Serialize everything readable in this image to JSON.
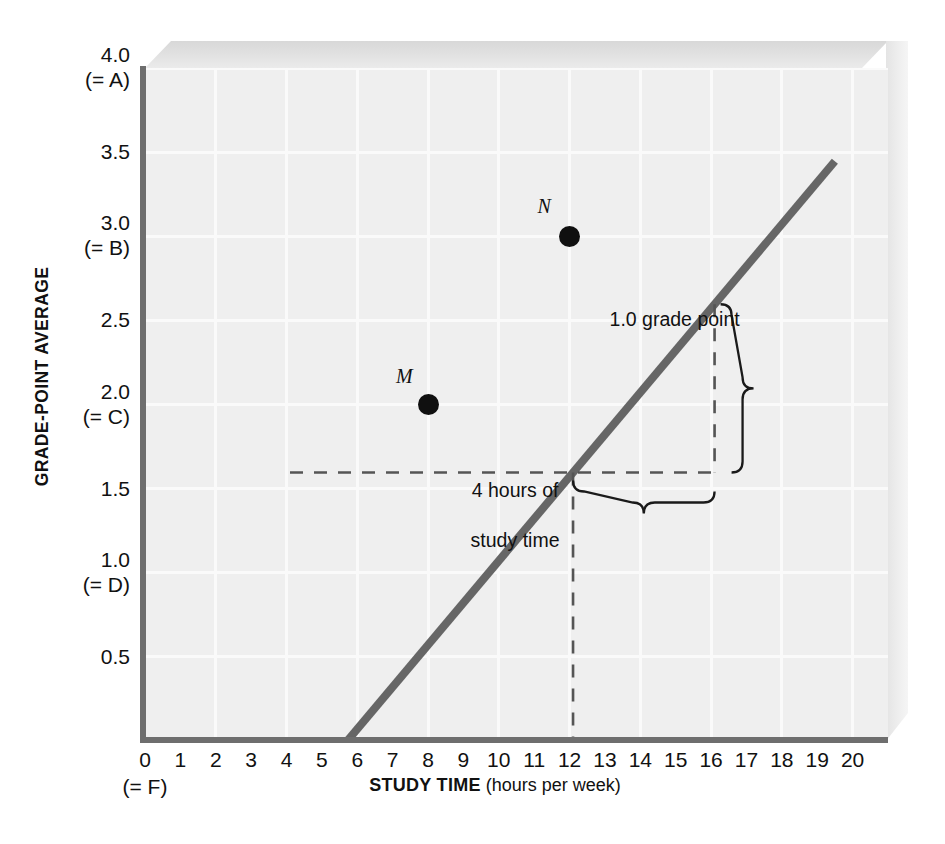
{
  "chart_data": {
    "type": "line",
    "title": "",
    "xlabel_bold": "STUDY TIME",
    "xlabel_rest": " (hours per week)",
    "ylabel": "GRADE-POINT AVERAGE",
    "xlim": [
      0,
      21
    ],
    "ylim": [
      0,
      4.0
    ],
    "grid": true,
    "legend": "none",
    "series": [
      {
        "name": "GPA vs study time",
        "x": [
          0,
          15.4
        ],
        "y": [
          0.0,
          3.85
        ],
        "slope": 0.25,
        "intercept": 0.0,
        "color": "#666666"
      }
    ],
    "x_ticks": [
      "0",
      "1",
      "2",
      "3",
      "4",
      "5",
      "6",
      "7",
      "8",
      "9",
      "10",
      "11",
      "12",
      "13",
      "14",
      "15",
      "16",
      "17",
      "18",
      "19",
      "20"
    ],
    "x_tick_sub": "(= F)",
    "y_ticks": [
      {
        "value": "4.0",
        "grade": "(= A)",
        "v": 4.0
      },
      {
        "value": "3.5",
        "grade": "",
        "v": 3.5
      },
      {
        "value": "3.0",
        "grade": "(= B)",
        "v": 3.0
      },
      {
        "value": "2.5",
        "grade": "",
        "v": 2.5
      },
      {
        "value": "2.0",
        "grade": "(= C)",
        "v": 2.0
      },
      {
        "value": "1.5",
        "grade": "",
        "v": 1.5
      },
      {
        "value": "1.0",
        "grade": "(= D)",
        "v": 1.0
      },
      {
        "value": "0.5",
        "grade": "",
        "v": 0.5
      }
    ],
    "points": [
      {
        "label": "M",
        "x": 8,
        "y": 2.0
      },
      {
        "label": "N",
        "x": 12,
        "y": 3.0
      }
    ],
    "annotations": [
      {
        "name": "rise-annotation",
        "text": "1.0 grade point",
        "rise": 1.0
      },
      {
        "name": "run-annotation",
        "line1": "4 hours of",
        "line2": "study time",
        "run": 4
      }
    ],
    "colors": {
      "plot_background": "#efefef",
      "gridline": "#fafafa",
      "axis": "#6e6e6e",
      "line": "#666666",
      "point": "#101010",
      "text": "#111111"
    }
  }
}
